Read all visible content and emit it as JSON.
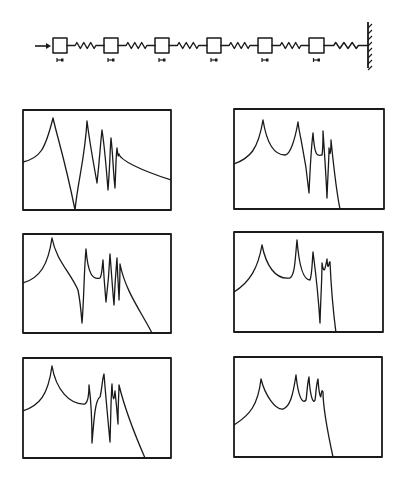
{
  "diagram": {
    "type": "mass-spring-chain",
    "input_arrow": {
      "x1": 35,
      "x2": 51,
      "y": 46
    },
    "mass_count": 6,
    "masses": [
      {
        "x": 53,
        "y": 38,
        "w": 14,
        "h": 15
      },
      {
        "x": 104,
        "y": 38,
        "w": 14,
        "h": 15
      },
      {
        "x": 155,
        "y": 38,
        "w": 14,
        "h": 15
      },
      {
        "x": 207,
        "y": 38,
        "w": 14,
        "h": 15
      },
      {
        "x": 258,
        "y": 38,
        "w": 14,
        "h": 15
      },
      {
        "x": 309,
        "y": 38,
        "w": 15,
        "h": 15
      }
    ],
    "springs": [
      {
        "x1": 67,
        "x2": 104
      },
      {
        "x1": 118,
        "x2": 155
      },
      {
        "x1": 169,
        "x2": 207
      },
      {
        "x1": 221,
        "x2": 258
      },
      {
        "x1": 272,
        "x2": 309
      },
      {
        "x1": 324,
        "x2": 368
      }
    ],
    "spring_y": 45,
    "wall": {
      "x": 368,
      "y1": 22,
      "y2": 68
    },
    "damper_markers_y": 60,
    "stroke_color": "#1a1a1a",
    "background": "#ffffff"
  },
  "panels": [
    {
      "name": "response-1",
      "x": 23,
      "y": 110,
      "w": 148,
      "h": 100,
      "path": "M23,162 C40,158 45,150 53,118 C58,140 65,160 75,210 C78,180 85,158 87,121 C90,145 93,160 97,183 C100,155 100,148 102,130 C105,150 106,165 108,190 C110,165 110,150 111,138 C113,155 113,170 115,188 C116,165 116,155 117,148 C118,155 118,158 119,154 C120,160 140,170 171,180"
    },
    {
      "name": "response-2",
      "x": 234,
      "y": 109,
      "w": 150,
      "h": 100,
      "path": "M234,164 C250,158 258,150 263,120 C267,145 275,155 285,155 C290,155 295,140 298,122 C300,140 305,150 309,193 C310,170 311,150 313,133 C315,160 318,155 322,155 C323,150 323,140 323,131 C325,160 326,175 327,198 C328,170 329,160 329,148 C330,160 331,150 331,140 C333,160 336,190 340,209"
    },
    {
      "name": "response-3",
      "x": 23,
      "y": 234,
      "w": 148,
      "h": 99,
      "path": "M23,283 C40,278 48,265 52,238 C56,260 70,272 78,290 C80,300 81,310 82,323 C84,300 84,270 86,249 C88,275 93,280 100,278 C102,275 102,268 103,260 C104,280 105,290 106,302 C108,285 109,275 110,254 C112,280 113,295 114,305 C115,280 116,270 117,258 C118,285 119,295 119,300 C120,280 120,270 120,264 C125,290 140,310 152,333"
    },
    {
      "name": "response-4",
      "x": 234,
      "y": 232,
      "w": 149,
      "h": 100,
      "path": "M234,292 C250,282 258,268 262,245 C266,265 275,280 290,278 C295,275 295,260 297,240 C299,265 303,280 310,280 C312,275 312,265 313,252 C316,275 318,290 320,323 C321,290 322,280 322,263 C324,275 325,270 327,259 C328,275 329,260 330,262 C331,285 333,310 336,333"
    },
    {
      "name": "response-5",
      "x": 23,
      "y": 358,
      "w": 148,
      "h": 100,
      "path": "M23,411 C40,405 48,395 52,366 C56,390 70,405 85,404 C88,402 89,395 89,385 C91,400 92,420 92,443 C94,420 95,400 100,397 C102,390 102,380 104,374 C106,400 108,420 110,442 C111,410 111,395 112,384 C113,405 114,400 115,391 C116,400 117,410 118,424 C118,400 119,395 119,385 C125,410 135,435 145,458"
    },
    {
      "name": "response-6",
      "x": 234,
      "y": 357,
      "w": 148,
      "h": 100,
      "path": "M234,425 C250,415 258,405 261,379 C265,395 275,410 283,409 C290,407 293,395 296,375 C298,395 302,405 306,400 C307,395 307,385 309,377 C310,395 313,405 315,400 C316,395 316,385 318,379 C319,395 321,400 321,395 C322,390 322,390 323,392 C323,400 325,420 333,457"
    }
  ]
}
